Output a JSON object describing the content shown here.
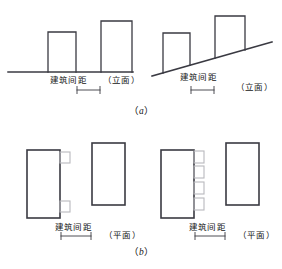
{
  "figure": {
    "title_text": "建筑间距示意图",
    "spacing_label": "建筑间距",
    "elevation_label": "（立面）",
    "plan_label": "（平面）",
    "caption_a_open": "（",
    "caption_a_letter": "a",
    "caption_a_close": "）",
    "caption_b_open": "（",
    "caption_b_letter": "b",
    "caption_b_close": "）",
    "line_color": "#3a3a42",
    "projection_color": "#b9b9bd",
    "background_color": "#ffffff",
    "text_color": "#141414"
  },
  "panels": [
    {
      "id": "a-left",
      "kind": "elevation",
      "ground": "flat",
      "view_label": "（立面）",
      "spacing_label": "建筑间距",
      "buildings": 2,
      "building_heights": [
        "short",
        "tall"
      ]
    },
    {
      "id": "a-right",
      "kind": "elevation",
      "ground": "sloped",
      "view_label": "（立面）",
      "spacing_label": "建筑间距",
      "buildings": 2,
      "building_heights": [
        "short",
        "tall"
      ]
    },
    {
      "id": "b-left",
      "kind": "plan",
      "view_label": "（平面）",
      "spacing_label": "建筑间距",
      "buildings": 2,
      "projections": 2
    },
    {
      "id": "b-right",
      "kind": "plan",
      "view_label": "（平面）",
      "spacing_label": "建筑间距",
      "buildings": 2,
      "projections": 4
    }
  ]
}
